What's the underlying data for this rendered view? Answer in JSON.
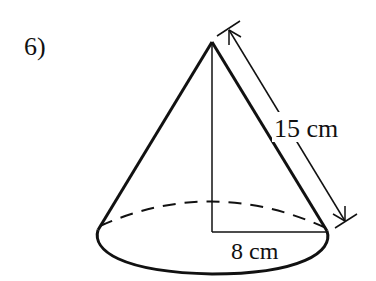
{
  "problem": {
    "number_label": "6)"
  },
  "diagram": {
    "shape": "right circular cone",
    "slant_height_label": "15 cm",
    "radius_label": "8 cm",
    "colors": {
      "stroke": "#111111",
      "background": "#ffffff"
    }
  }
}
